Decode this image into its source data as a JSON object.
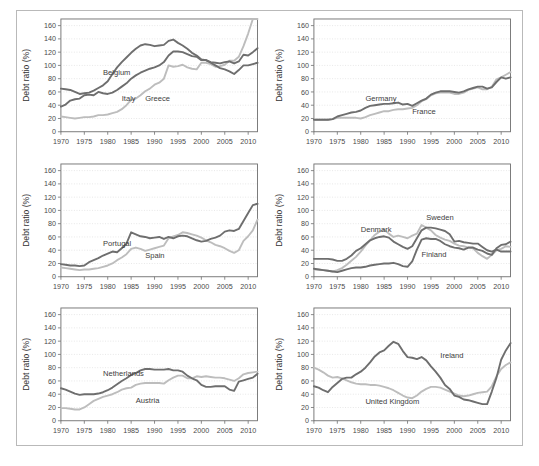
{
  "figure": {
    "ylabel": "Debt ratio (%)",
    "colors": {
      "dark": "#6e6e6e",
      "light": "#bdbdbd",
      "grid": "#d6d6d6",
      "axis": "#6e6e6e",
      "frame": "#b9b9b9"
    },
    "y_ticks": [
      0,
      20,
      40,
      60,
      80,
      100,
      120,
      140,
      160
    ],
    "x_ticks": [
      1970,
      1975,
      1980,
      1985,
      1990,
      1995,
      2000,
      2005,
      2010
    ],
    "xlim": [
      1970,
      2012
    ],
    "ylim": [
      0,
      170
    ],
    "grid": true,
    "legend_position": "inline-annotations"
  },
  "chart_data": [
    {
      "type": "line",
      "panel": 1,
      "title": "",
      "xlabel": "",
      "ylabel": "Debt ratio (%)",
      "xlim": [
        1970,
        2012
      ],
      "ylim": [
        0,
        170
      ],
      "grid": true,
      "x": [
        1970,
        1971,
        1972,
        1973,
        1974,
        1975,
        1976,
        1977,
        1978,
        1979,
        1980,
        1981,
        1982,
        1983,
        1984,
        1985,
        1986,
        1987,
        1988,
        1989,
        1990,
        1991,
        1992,
        1993,
        1994,
        1995,
        1996,
        1997,
        1998,
        1999,
        2000,
        2001,
        2002,
        2003,
        2004,
        2005,
        2006,
        2007,
        2008,
        2009,
        2010,
        2011,
        2012
      ],
      "series": [
        {
          "name": "Belgium",
          "color": "#6e6e6e",
          "label_x": 1979,
          "label_y": 86,
          "values": [
            65,
            64,
            63,
            60,
            57,
            58,
            59,
            62,
            66,
            70,
            76,
            87,
            97,
            105,
            112,
            119,
            125,
            130,
            132,
            131,
            129,
            130,
            131,
            137,
            139,
            134,
            130,
            125,
            119,
            115,
            109,
            108,
            104,
            100,
            96,
            94,
            91,
            87,
            93,
            100,
            100,
            102,
            104
          ]
        },
        {
          "name": "Italy",
          "color": "#6e6e6e",
          "label_x": 1983,
          "label_y": 47,
          "values": [
            38,
            41,
            47,
            49,
            50,
            55,
            56,
            55,
            60,
            58,
            57,
            59,
            63,
            68,
            73,
            80,
            85,
            89,
            92,
            95,
            97,
            100,
            105,
            115,
            121,
            121,
            120,
            117,
            114,
            113,
            108,
            108,
            105,
            104,
            103,
            105,
            106,
            103,
            106,
            116,
            115,
            120,
            126
          ]
        },
        {
          "name": "Greece",
          "color": "#bdbdbd",
          "label_x": 1988,
          "label_y": 47,
          "values": [
            23,
            22,
            21,
            20,
            21,
            22,
            22,
            23,
            25,
            25,
            26,
            28,
            30,
            34,
            40,
            48,
            50,
            55,
            61,
            65,
            71,
            74,
            80,
            100,
            98,
            99,
            101,
            97,
            95,
            94,
            104,
            104,
            102,
            98,
            99,
            101,
            107,
            107,
            113,
            129,
            148,
            170,
            170
          ]
        }
      ]
    },
    {
      "type": "line",
      "panel": 2,
      "title": "",
      "xlabel": "",
      "ylabel": "Debt ratio (%)",
      "xlim": [
        1970,
        2012
      ],
      "ylim": [
        0,
        170
      ],
      "grid": true,
      "x": [
        1970,
        1971,
        1972,
        1973,
        1974,
        1975,
        1976,
        1977,
        1978,
        1979,
        1980,
        1981,
        1982,
        1983,
        1984,
        1985,
        1986,
        1987,
        1988,
        1989,
        1990,
        1991,
        1992,
        1993,
        1994,
        1995,
        1996,
        1997,
        1998,
        1999,
        2000,
        2001,
        2002,
        2003,
        2004,
        2005,
        2006,
        2007,
        2008,
        2009,
        2010,
        2011,
        2012
      ],
      "series": [
        {
          "name": "Germany",
          "color": "#6e6e6e",
          "label_x": 1981,
          "label_y": 46,
          "values": [
            18,
            18,
            18,
            18,
            19,
            23,
            25,
            27,
            29,
            30,
            32,
            36,
            39,
            40,
            41,
            42,
            42,
            43,
            44,
            41,
            42,
            39,
            43,
            47,
            50,
            56,
            59,
            61,
            61,
            61,
            60,
            59,
            61,
            64,
            66,
            68,
            68,
            65,
            67,
            75,
            82,
            80,
            82
          ]
        },
        {
          "name": "France",
          "color": "#bdbdbd",
          "label_x": 1991,
          "label_y": 26,
          "values": [
            18,
            18,
            18,
            18,
            19,
            21,
            21,
            21,
            21,
            21,
            20,
            22,
            25,
            27,
            29,
            31,
            31,
            33,
            34,
            34,
            35,
            36,
            40,
            46,
            49,
            55,
            58,
            59,
            59,
            59,
            57,
            57,
            59,
            63,
            65,
            67,
            64,
            64,
            68,
            79,
            82,
            86,
            90
          ]
        }
      ]
    },
    {
      "type": "line",
      "panel": 3,
      "title": "",
      "xlabel": "",
      "ylabel": "Debt ratio (%)",
      "xlim": [
        1970,
        2012
      ],
      "ylim": [
        0,
        170
      ],
      "grid": true,
      "x": [
        1970,
        1971,
        1972,
        1973,
        1974,
        1975,
        1976,
        1977,
        1978,
        1979,
        1980,
        1981,
        1982,
        1983,
        1984,
        1985,
        1986,
        1987,
        1988,
        1989,
        1990,
        1991,
        1992,
        1993,
        1994,
        1995,
        1996,
        1997,
        1998,
        1999,
        2000,
        2001,
        2002,
        2003,
        2004,
        2005,
        2006,
        2007,
        2008,
        2009,
        2010,
        2011,
        2012
      ],
      "series": [
        {
          "name": "Portugal",
          "color": "#6e6e6e",
          "label_x": 1979,
          "label_y": 47,
          "values": [
            19,
            18,
            17,
            17,
            16,
            17,
            22,
            25,
            28,
            32,
            35,
            38,
            37,
            43,
            50,
            67,
            64,
            61,
            60,
            58,
            59,
            60,
            57,
            60,
            58,
            61,
            62,
            61,
            58,
            55,
            53,
            54,
            57,
            59,
            62,
            68,
            70,
            69,
            72,
            84,
            96,
            108,
            110
          ]
        },
        {
          "name": "Spain",
          "color": "#bdbdbd",
          "label_x": 1988,
          "label_y": 28,
          "values": [
            14,
            13,
            12,
            11,
            10,
            11,
            11,
            12,
            13,
            15,
            17,
            20,
            25,
            29,
            34,
            42,
            44,
            42,
            39,
            41,
            43,
            45,
            47,
            58,
            61,
            63,
            67,
            66,
            64,
            62,
            59,
            55,
            52,
            48,
            46,
            43,
            39,
            36,
            40,
            54,
            61,
            70,
            86
          ]
        }
      ]
    },
    {
      "type": "line",
      "panel": 4,
      "title": "",
      "xlabel": "",
      "ylabel": "Debt ratio (%)",
      "xlim": [
        1970,
        2012
      ],
      "ylim": [
        0,
        170
      ],
      "grid": true,
      "x": [
        1970,
        1971,
        1972,
        1973,
        1974,
        1975,
        1976,
        1977,
        1978,
        1979,
        1980,
        1981,
        1982,
        1983,
        1984,
        1985,
        1986,
        1987,
        1988,
        1989,
        1990,
        1991,
        1992,
        1993,
        1994,
        1995,
        1996,
        1997,
        1998,
        1999,
        2000,
        2001,
        2002,
        2003,
        2004,
        2005,
        2006,
        2007,
        2008,
        2009,
        2010,
        2011,
        2012
      ],
      "series": [
        {
          "name": "Denmark",
          "color": "#bdbdbd",
          "label_x": 1980,
          "label_y": 67,
          "values": [
            11,
            11,
            10,
            9,
            8,
            10,
            13,
            18,
            24,
            30,
            38,
            47,
            55,
            63,
            68,
            71,
            65,
            60,
            62,
            60,
            58,
            62,
            65,
            78,
            74,
            70,
            63,
            59,
            56,
            54,
            50,
            47,
            46,
            44,
            43,
            36,
            31,
            27,
            33,
            40,
            42,
            46,
            45
          ]
        },
        {
          "name": "Sweden",
          "color": "#6e6e6e",
          "label_x": 1994,
          "label_y": 86,
          "values": [
            27,
            27,
            27,
            27,
            26,
            24,
            24,
            27,
            32,
            39,
            43,
            49,
            55,
            58,
            60,
            61,
            59,
            53,
            49,
            45,
            42,
            46,
            58,
            70,
            74,
            74,
            73,
            71,
            69,
            64,
            53,
            54,
            52,
            51,
            50,
            50,
            45,
            40,
            38,
            41,
            38,
            38,
            38
          ]
        },
        {
          "name": "Finland",
          "color": "#6e6e6e",
          "label_x": 1993,
          "label_y": 30,
          "values": [
            12,
            11,
            10,
            9,
            8,
            7,
            9,
            11,
            13,
            14,
            14,
            15,
            17,
            18,
            19,
            20,
            20,
            21,
            19,
            16,
            15,
            23,
            41,
            56,
            58,
            57,
            57,
            54,
            49,
            46,
            44,
            43,
            41,
            44,
            44,
            41,
            39,
            35,
            33,
            43,
            48,
            49,
            53
          ]
        }
      ]
    },
    {
      "type": "line",
      "panel": 5,
      "title": "",
      "xlabel": "",
      "ylabel": "Debt ratio (%)",
      "xlim": [
        1970,
        2012
      ],
      "ylim": [
        0,
        170
      ],
      "grid": true,
      "x": [
        1970,
        1971,
        1972,
        1973,
        1974,
        1975,
        1976,
        1977,
        1978,
        1979,
        1980,
        1981,
        1982,
        1983,
        1984,
        1985,
        1986,
        1987,
        1988,
        1989,
        1990,
        1991,
        1992,
        1993,
        1994,
        1995,
        1996,
        1997,
        1998,
        1999,
        2000,
        2001,
        2002,
        2003,
        2004,
        2005,
        2006,
        2007,
        2008,
        2009,
        2010,
        2011,
        2012
      ],
      "series": [
        {
          "name": "Netherlands",
          "color": "#6e6e6e",
          "label_x": 1979,
          "label_y": 68,
          "values": [
            49,
            47,
            44,
            41,
            39,
            40,
            40,
            40,
            41,
            43,
            46,
            50,
            55,
            60,
            64,
            69,
            72,
            76,
            78,
            78,
            77,
            77,
            77,
            78,
            76,
            76,
            74,
            68,
            64,
            61,
            54,
            51,
            51,
            52,
            52,
            52,
            47,
            45,
            59,
            61,
            63,
            65,
            71
          ]
        },
        {
          "name": "Austria",
          "color": "#bdbdbd",
          "label_x": 1986,
          "label_y": 27,
          "values": [
            19,
            19,
            18,
            17,
            17,
            20,
            25,
            30,
            33,
            36,
            38,
            40,
            43,
            47,
            49,
            50,
            54,
            56,
            57,
            57,
            57,
            57,
            56,
            61,
            65,
            68,
            68,
            64,
            64,
            67,
            66,
            67,
            66,
            65,
            65,
            64,
            62,
            60,
            64,
            70,
            72,
            73,
            74
          ]
        }
      ]
    },
    {
      "type": "line",
      "panel": 6,
      "title": "",
      "xlabel": "",
      "ylabel": "Debt ratio (%)",
      "xlim": [
        1970,
        2012
      ],
      "ylim": [
        0,
        170
      ],
      "grid": true,
      "x": [
        1970,
        1971,
        1972,
        1973,
        1974,
        1975,
        1976,
        1977,
        1978,
        1979,
        1980,
        1981,
        1982,
        1983,
        1984,
        1985,
        1986,
        1987,
        1988,
        1989,
        1990,
        1991,
        1992,
        1993,
        1994,
        1995,
        1996,
        1997,
        1998,
        1999,
        2000,
        2001,
        2002,
        2003,
        2004,
        2005,
        2006,
        2007,
        2008,
        2009,
        2010,
        2011,
        2012
      ],
      "series": [
        {
          "name": "Ireland",
          "color": "#6e6e6e",
          "label_x": 1997,
          "label_y": 94,
          "values": [
            52,
            50,
            46,
            43,
            51,
            57,
            63,
            65,
            65,
            70,
            74,
            80,
            88,
            97,
            103,
            106,
            113,
            119,
            116,
            105,
            96,
            95,
            93,
            96,
            91,
            82,
            74,
            65,
            54,
            48,
            38,
            36,
            32,
            31,
            29,
            27,
            25,
            25,
            44,
            65,
            92,
            106,
            117
          ]
        },
        {
          "name": "United Kingdom",
          "color": "#bdbdbd",
          "label_x": 1981,
          "label_y": 25,
          "values": [
            80,
            77,
            73,
            68,
            65,
            66,
            64,
            61,
            58,
            56,
            55,
            55,
            54,
            54,
            53,
            51,
            49,
            46,
            42,
            38,
            35,
            34,
            38,
            44,
            48,
            51,
            51,
            50,
            47,
            44,
            41,
            38,
            37,
            38,
            40,
            42,
            43,
            44,
            52,
            67,
            78,
            84,
            88
          ]
        }
      ]
    }
  ]
}
